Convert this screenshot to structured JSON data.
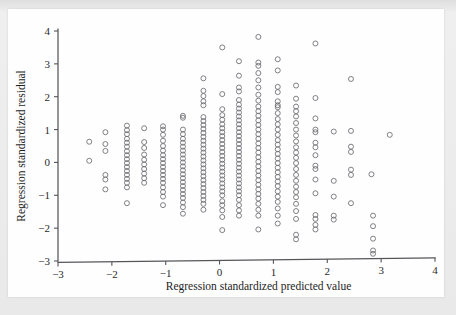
{
  "figure": {
    "background_color": "#e8e8e8",
    "panel_color": "#fefefe",
    "axis_color": "#55555a",
    "marker_color": "#6a6a70"
  },
  "chart_data": {
    "type": "scatter",
    "title": "",
    "xlabel": "Regression standardized predicted value",
    "ylabel": "Regression standardized residual",
    "xlim": [
      -3,
      4
    ],
    "ylim": [
      -3,
      4
    ],
    "xticks": [
      -3,
      -2,
      -1,
      0,
      1,
      2,
      3,
      4
    ],
    "xtick_labels": [
      "−3",
      "−2",
      "−1",
      "0",
      "1",
      "2",
      "3",
      "4"
    ],
    "yticks": [
      -3,
      -2,
      -1,
      0,
      1,
      2,
      3,
      4
    ],
    "ytick_labels": [
      "−3",
      "−2",
      "−1",
      "0",
      "1",
      "2",
      "3",
      "4"
    ],
    "grid": false,
    "legend": null,
    "marker": "open-circle",
    "marker_size": 5,
    "points": [
      [
        -2.42,
        0.63
      ],
      [
        -2.42,
        0.05
      ],
      [
        -2.12,
        0.92
      ],
      [
        -2.12,
        0.56
      ],
      [
        -2.12,
        0.35
      ],
      [
        -2.12,
        -0.38
      ],
      [
        -2.12,
        -0.52
      ],
      [
        -2.12,
        -0.82
      ],
      [
        -1.72,
        1.12
      ],
      [
        -1.72,
        0.98
      ],
      [
        -1.72,
        0.86
      ],
      [
        -1.72,
        0.72
      ],
      [
        -1.72,
        0.6
      ],
      [
        -1.72,
        0.48
      ],
      [
        -1.72,
        0.34
      ],
      [
        -1.72,
        0.22
      ],
      [
        -1.72,
        0.1
      ],
      [
        -1.72,
        -0.02
      ],
      [
        -1.72,
        -0.14
      ],
      [
        -1.72,
        -0.26
      ],
      [
        -1.72,
        -0.38
      ],
      [
        -1.72,
        -0.5
      ],
      [
        -1.72,
        -0.62
      ],
      [
        -1.72,
        -0.76
      ],
      [
        -1.72,
        -1.24
      ],
      [
        -1.4,
        1.04
      ],
      [
        -1.4,
        0.62
      ],
      [
        -1.4,
        0.44
      ],
      [
        -1.4,
        0.24
      ],
      [
        -1.4,
        0.08
      ],
      [
        -1.4,
        -0.06
      ],
      [
        -1.4,
        -0.2
      ],
      [
        -1.4,
        -0.34
      ],
      [
        -1.4,
        -0.48
      ],
      [
        -1.4,
        -0.62
      ],
      [
        -1.05,
        1.1
      ],
      [
        -1.05,
        1.0
      ],
      [
        -1.05,
        0.84
      ],
      [
        -1.05,
        0.66
      ],
      [
        -1.05,
        0.5
      ],
      [
        -1.05,
        0.36
      ],
      [
        -1.05,
        0.22
      ],
      [
        -1.05,
        0.1
      ],
      [
        -1.05,
        -0.02
      ],
      [
        -1.05,
        -0.14
      ],
      [
        -1.05,
        -0.26
      ],
      [
        -1.05,
        -0.38
      ],
      [
        -1.05,
        -0.5
      ],
      [
        -1.05,
        -0.62
      ],
      [
        -1.05,
        -0.76
      ],
      [
        -1.05,
        -0.9
      ],
      [
        -1.05,
        -1.04
      ],
      [
        -1.05,
        -1.3
      ],
      [
        -0.68,
        1.42
      ],
      [
        -0.68,
        1.36
      ],
      [
        -0.68,
        1.0
      ],
      [
        -0.68,
        0.86
      ],
      [
        -0.68,
        0.72
      ],
      [
        -0.68,
        0.6
      ],
      [
        -0.68,
        0.48
      ],
      [
        -0.68,
        0.36
      ],
      [
        -0.68,
        0.24
      ],
      [
        -0.68,
        0.12
      ],
      [
        -0.68,
        0.0
      ],
      [
        -0.68,
        -0.12
      ],
      [
        -0.68,
        -0.24
      ],
      [
        -0.68,
        -0.36
      ],
      [
        -0.68,
        -0.48
      ],
      [
        -0.68,
        -0.6
      ],
      [
        -0.68,
        -0.72
      ],
      [
        -0.68,
        -0.84
      ],
      [
        -0.68,
        -0.96
      ],
      [
        -0.68,
        -1.08
      ],
      [
        -0.68,
        -1.22
      ],
      [
        -0.68,
        -1.36
      ],
      [
        -0.68,
        -1.56
      ],
      [
        -0.3,
        2.56
      ],
      [
        -0.3,
        2.18
      ],
      [
        -0.3,
        2.02
      ],
      [
        -0.3,
        1.86
      ],
      [
        -0.3,
        1.74
      ],
      [
        -0.3,
        1.38
      ],
      [
        -0.3,
        1.26
      ],
      [
        -0.3,
        1.14
      ],
      [
        -0.3,
        1.02
      ],
      [
        -0.3,
        0.9
      ],
      [
        -0.3,
        0.78
      ],
      [
        -0.3,
        0.66
      ],
      [
        -0.3,
        0.54
      ],
      [
        -0.3,
        0.42
      ],
      [
        -0.3,
        0.3
      ],
      [
        -0.3,
        0.18
      ],
      [
        -0.3,
        0.06
      ],
      [
        -0.3,
        -0.06
      ],
      [
        -0.3,
        -0.18
      ],
      [
        -0.3,
        -0.3
      ],
      [
        -0.3,
        -0.42
      ],
      [
        -0.3,
        -0.54
      ],
      [
        -0.3,
        -0.66
      ],
      [
        -0.3,
        -0.78
      ],
      [
        -0.3,
        -0.9
      ],
      [
        -0.3,
        -1.02
      ],
      [
        -0.3,
        -1.14
      ],
      [
        -0.3,
        -1.26
      ],
      [
        -0.3,
        -1.44
      ],
      [
        0.05,
        3.5
      ],
      [
        0.05,
        2.08
      ],
      [
        0.05,
        1.62
      ],
      [
        0.05,
        1.44
      ],
      [
        0.05,
        1.3
      ],
      [
        0.05,
        1.16
      ],
      [
        0.05,
        1.04
      ],
      [
        0.05,
        0.92
      ],
      [
        0.05,
        0.8
      ],
      [
        0.05,
        0.68
      ],
      [
        0.05,
        0.56
      ],
      [
        0.05,
        0.44
      ],
      [
        0.05,
        0.32
      ],
      [
        0.05,
        0.2
      ],
      [
        0.05,
        0.08
      ],
      [
        0.05,
        -0.04
      ],
      [
        0.05,
        -0.16
      ],
      [
        0.05,
        -0.28
      ],
      [
        0.05,
        -0.4
      ],
      [
        0.05,
        -0.52
      ],
      [
        0.05,
        -0.64
      ],
      [
        0.05,
        -0.76
      ],
      [
        0.05,
        -0.88
      ],
      [
        0.05,
        -1.0
      ],
      [
        0.05,
        -1.18
      ],
      [
        0.05,
        -1.3
      ],
      [
        0.05,
        -1.46
      ],
      [
        0.05,
        -1.66
      ],
      [
        0.05,
        -2.06
      ],
      [
        0.36,
        3.08
      ],
      [
        0.36,
        2.64
      ],
      [
        0.36,
        2.28
      ],
      [
        0.36,
        2.16
      ],
      [
        0.36,
        1.9
      ],
      [
        0.36,
        1.76
      ],
      [
        0.36,
        1.64
      ],
      [
        0.36,
        1.52
      ],
      [
        0.36,
        1.4
      ],
      [
        0.36,
        1.28
      ],
      [
        0.36,
        1.16
      ],
      [
        0.36,
        1.04
      ],
      [
        0.36,
        0.92
      ],
      [
        0.36,
        0.8
      ],
      [
        0.36,
        0.68
      ],
      [
        0.36,
        0.56
      ],
      [
        0.36,
        0.44
      ],
      [
        0.36,
        0.32
      ],
      [
        0.36,
        0.2
      ],
      [
        0.36,
        0.08
      ],
      [
        0.36,
        -0.04
      ],
      [
        0.36,
        -0.16
      ],
      [
        0.36,
        -0.28
      ],
      [
        0.36,
        -0.4
      ],
      [
        0.36,
        -0.52
      ],
      [
        0.36,
        -0.64
      ],
      [
        0.36,
        -0.76
      ],
      [
        0.36,
        -0.88
      ],
      [
        0.36,
        -1.0
      ],
      [
        0.36,
        -1.14
      ],
      [
        0.36,
        -1.3
      ],
      [
        0.36,
        -1.46
      ],
      [
        0.36,
        -1.62
      ],
      [
        0.72,
        3.82
      ],
      [
        0.72,
        3.04
      ],
      [
        0.72,
        2.94
      ],
      [
        0.72,
        2.72
      ],
      [
        0.72,
        2.5
      ],
      [
        0.72,
        2.28
      ],
      [
        0.72,
        2.06
      ],
      [
        0.72,
        1.88
      ],
      [
        0.72,
        1.7
      ],
      [
        0.72,
        1.56
      ],
      [
        0.72,
        1.42
      ],
      [
        0.72,
        1.28
      ],
      [
        0.72,
        1.14
      ],
      [
        0.72,
        1.0
      ],
      [
        0.72,
        0.86
      ],
      [
        0.72,
        0.72
      ],
      [
        0.72,
        0.58
      ],
      [
        0.72,
        0.44
      ],
      [
        0.72,
        0.3
      ],
      [
        0.72,
        0.16
      ],
      [
        0.72,
        0.02
      ],
      [
        0.72,
        -0.12
      ],
      [
        0.72,
        -0.26
      ],
      [
        0.72,
        -0.4
      ],
      [
        0.72,
        -0.54
      ],
      [
        0.72,
        -0.68
      ],
      [
        0.72,
        -0.82
      ],
      [
        0.72,
        -0.96
      ],
      [
        0.72,
        -1.1
      ],
      [
        0.72,
        -1.26
      ],
      [
        0.72,
        -1.44
      ],
      [
        0.72,
        -1.62
      ],
      [
        0.72,
        -2.04
      ],
      [
        1.08,
        3.14
      ],
      [
        1.08,
        2.8
      ],
      [
        1.08,
        2.3
      ],
      [
        1.08,
        2.14
      ],
      [
        1.08,
        1.86
      ],
      [
        1.08,
        1.74
      ],
      [
        1.08,
        1.68
      ],
      [
        1.08,
        1.5
      ],
      [
        1.08,
        1.32
      ],
      [
        1.08,
        1.16
      ],
      [
        1.08,
        1.0
      ],
      [
        1.08,
        0.84
      ],
      [
        1.08,
        0.68
      ],
      [
        1.08,
        0.54
      ],
      [
        1.08,
        0.4
      ],
      [
        1.08,
        0.26
      ],
      [
        1.08,
        0.12
      ],
      [
        1.08,
        -0.02
      ],
      [
        1.08,
        -0.16
      ],
      [
        1.08,
        -0.3
      ],
      [
        1.08,
        -0.44
      ],
      [
        1.08,
        -0.58
      ],
      [
        1.08,
        -0.72
      ],
      [
        1.08,
        -0.88
      ],
      [
        1.08,
        -1.04
      ],
      [
        1.08,
        -1.2
      ],
      [
        1.08,
        -1.4
      ],
      [
        1.08,
        -1.62
      ],
      [
        1.08,
        -1.86
      ],
      [
        1.42,
        2.34
      ],
      [
        1.42,
        1.94
      ],
      [
        1.42,
        1.7
      ],
      [
        1.42,
        1.56
      ],
      [
        1.42,
        1.4
      ],
      [
        1.42,
        1.2
      ],
      [
        1.42,
        1.0
      ],
      [
        1.42,
        0.82
      ],
      [
        1.42,
        0.64
      ],
      [
        1.42,
        0.46
      ],
      [
        1.42,
        0.3
      ],
      [
        1.42,
        0.14
      ],
      [
        1.42,
        -0.02
      ],
      [
        1.42,
        -0.2
      ],
      [
        1.42,
        -0.38
      ],
      [
        1.42,
        -0.56
      ],
      [
        1.42,
        -0.74
      ],
      [
        1.42,
        -0.9
      ],
      [
        1.42,
        -1.06
      ],
      [
        1.42,
        -1.26
      ],
      [
        1.42,
        -1.48
      ],
      [
        1.42,
        -1.72
      ],
      [
        1.42,
        -2.2
      ],
      [
        1.42,
        -2.34
      ],
      [
        1.78,
        3.62
      ],
      [
        1.78,
        1.96
      ],
      [
        1.78,
        1.34
      ],
      [
        1.78,
        1.0
      ],
      [
        1.78,
        0.92
      ],
      [
        1.78,
        0.6
      ],
      [
        1.78,
        0.46
      ],
      [
        1.78,
        0.22
      ],
      [
        1.78,
        -0.1
      ],
      [
        1.78,
        -0.2
      ],
      [
        1.78,
        -0.52
      ],
      [
        1.78,
        -0.94
      ],
      [
        1.78,
        -1.6
      ],
      [
        1.78,
        -1.72
      ],
      [
        1.78,
        -1.9
      ],
      [
        1.78,
        -2.04
      ],
      [
        2.12,
        0.94
      ],
      [
        2.12,
        -0.56
      ],
      [
        2.12,
        -1.04
      ],
      [
        2.12,
        -1.62
      ],
      [
        2.12,
        -1.74
      ],
      [
        2.44,
        2.54
      ],
      [
        2.44,
        0.96
      ],
      [
        2.44,
        0.48
      ],
      [
        2.44,
        0.32
      ],
      [
        2.44,
        -0.22
      ],
      [
        2.44,
        -0.38
      ],
      [
        2.44,
        -1.24
      ],
      [
        2.82,
        -0.36
      ],
      [
        2.85,
        -1.62
      ],
      [
        2.85,
        -1.94
      ],
      [
        2.85,
        -2.32
      ],
      [
        2.85,
        -2.68
      ],
      [
        2.85,
        -2.78
      ],
      [
        3.16,
        0.84
      ]
    ]
  }
}
